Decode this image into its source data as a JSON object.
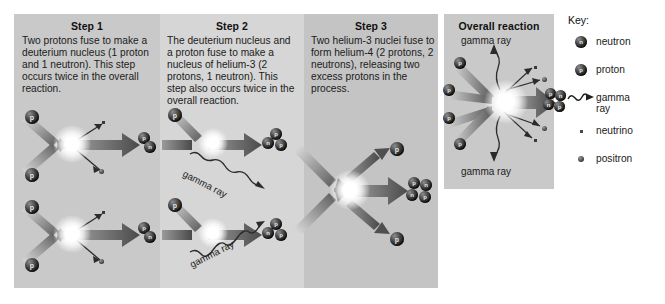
{
  "steps": [
    {
      "title": "Step 1",
      "text": "Two protons fuse to make a deuterium nucleus (1 proton and 1 neutron). This step occurs twice in the overall reaction."
    },
    {
      "title": "Step 2",
      "text": "The deuterium nucleus and a proton fuse to make a nucleus of helium-3 (2 protons, 1 neutron). This step also occurs twice in the overall reaction."
    },
    {
      "title": "Step 3",
      "text": "Two helium-3 nuclei fuse to form helium-4 (2 protons, 2 neutrons), releasing two excess protons in the process."
    }
  ],
  "overall": {
    "title": "Overall reaction",
    "gamma_top": "gamma ray",
    "gamma_bottom": "gamma ray"
  },
  "step2_labels": {
    "gamma_upper": "gamma ray",
    "gamma_lower": "gamma ray"
  },
  "key": {
    "title": "Key:",
    "items": [
      {
        "glyph": "neutron-sphere-icon",
        "label": "neutron",
        "symbol": "n"
      },
      {
        "glyph": "proton-sphere-icon",
        "label": "proton",
        "symbol": "p"
      },
      {
        "glyph": "gamma-ray-wave-icon",
        "label": "gamma ray",
        "symbol": ""
      },
      {
        "glyph": "neutrino-dot-icon",
        "label": "neutrino",
        "symbol": ""
      },
      {
        "glyph": "positron-dot-icon",
        "label": "positron",
        "symbol": ""
      }
    ]
  },
  "particle_symbols": {
    "proton": "p",
    "neutron": "n"
  },
  "colors": {
    "band_light": "#d6d6d6",
    "band_mid": "#c9c9c9",
    "band_dark": "#c4c4c4",
    "arrow_dark": "#4f4f4f",
    "arrow_light": "#d8d8d8",
    "text": "#1b1b1b"
  }
}
